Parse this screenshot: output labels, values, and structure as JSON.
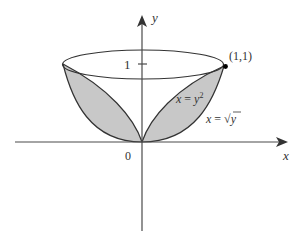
{
  "diagram": {
    "type": "solid-of-revolution",
    "axes": {
      "x_label": "x",
      "y_label": "y",
      "origin_label": "0",
      "y_tick_label": "1"
    },
    "point": {
      "label": "(1,1)"
    },
    "curves": [
      {
        "id": "parabola-y2",
        "label_var": "x",
        "label_eq": " = ",
        "label_rhs": "y",
        "label_sup": "2"
      },
      {
        "id": "sqrt-y",
        "label_var": "x",
        "label_eq": " = ",
        "label_rhs": "y",
        "label_radical": "√"
      }
    ],
    "colors": {
      "axis": "#4a4a4a",
      "outline": "#333333",
      "shaded_fill": "#c8c8c8",
      "point": "#000000",
      "text": "#333333"
    }
  }
}
